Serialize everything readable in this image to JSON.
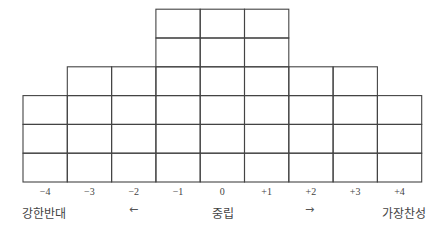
{
  "chart_data": {
    "type": "bar",
    "title": "",
    "categories": [
      "-4",
      "-3",
      "-2",
      "-1",
      "0",
      "+1",
      "+2",
      "+3",
      "+4"
    ],
    "values": [
      3,
      4,
      4,
      6,
      6,
      6,
      4,
      4,
      3
    ],
    "xlabel": "",
    "ylabel": "",
    "ylim": [
      0,
      6
    ],
    "grid": true,
    "legend": null
  },
  "scale": {
    "ticks": [
      "-4",
      "-3",
      "-2",
      "-1",
      "0",
      "+1",
      "+2",
      "+3",
      "+4"
    ],
    "left_label": "강한반대",
    "center_label": "중립",
    "right_label": "가장찬성",
    "left_arrow": "←",
    "right_arrow": "→"
  },
  "colors": {
    "line": "#444444",
    "background": "#ffffff"
  }
}
